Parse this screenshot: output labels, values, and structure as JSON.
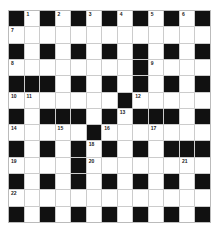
{
  "puzzle": {
    "type": "crossword",
    "rows": 13,
    "cols": 13,
    "colors": {
      "block": "#111111",
      "cell": "#ffffff",
      "gridline": "#cccccc"
    },
    "layout": [
      "#1#2#3#4#5#6#",
      "7............",
      "#.#.#.#.#.#.#",
      "8.......#9...",
      "###.#.#.#.#.#",
      "AB.....#C....",
      "#.###.#D###.#",
      "E..F.#G..H...",
      "#.#.#I#.#.###",
      "J...#K.....L.",
      "#.#.#.#.#.#.#",
      "M............",
      "#.#.#.#.#.#.#"
    ],
    "numbers": {
      "0,1": "1",
      "0,3": "2",
      "0,5": "3",
      "0,7": "4",
      "0,9": "5",
      "0,11": "6",
      "1,0": "7",
      "3,0": "8",
      "3,9": "9",
      "5,0": "10",
      "5,1": "11",
      "5,8": "12",
      "6,7": "13",
      "7,0": "14",
      "7,3": "15",
      "7,6": "16",
      "7,9": "17",
      "8,5": "18",
      "9,0": "19",
      "9,5": "20",
      "9,11": "21",
      "11,0": "22"
    }
  }
}
